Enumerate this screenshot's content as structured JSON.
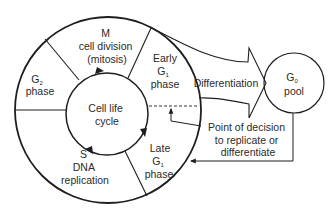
{
  "diagram": {
    "type": "cell-cycle",
    "center_label": {
      "line1": "Cell life",
      "line2": "cycle"
    },
    "phases": [
      {
        "id": "m",
        "line1": "M",
        "line2": "cell division",
        "line3": "(mitosis)"
      },
      {
        "id": "early-g1",
        "line1": "Early",
        "line2_main": "G",
        "line2_sub": "1",
        "line3": "phase"
      },
      {
        "id": "late-g1",
        "line1": "Late",
        "line2_main": "G",
        "line2_sub": "1",
        "line3": "phase"
      },
      {
        "id": "s",
        "line1": "S",
        "line2": "DNA",
        "line3": "replication"
      },
      {
        "id": "g2",
        "line1_main": "G",
        "line1_sub": "2",
        "line2": "phase"
      }
    ],
    "differentiation_arrow": {
      "label": "Differentiation"
    },
    "g0_pool": {
      "line1_main": "G",
      "line1_sub": "0",
      "line2": "pool"
    },
    "decision_point": {
      "line1": "Point of decision",
      "line2": "to replicate or",
      "line3": "differentiate"
    },
    "colors": {
      "line": "#1e1e1e",
      "text": "#2a2a2a",
      "background": "#ffffff"
    }
  }
}
